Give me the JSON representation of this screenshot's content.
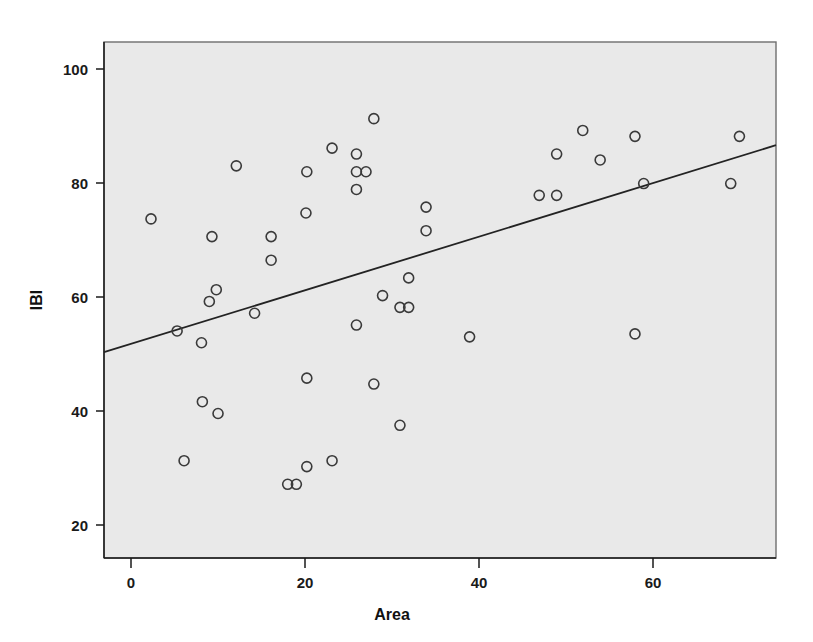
{
  "chart_data": {
    "type": "scatter",
    "title": "",
    "subtitle": "",
    "xlabel": "Area",
    "ylabel": "IBI",
    "xlim": [
      -3,
      74.2
    ],
    "ylim": [
      16.5,
      104
    ],
    "grid": false,
    "legend": null,
    "xticks": [
      0,
      20,
      40,
      60
    ],
    "xtick_labels": [
      "0",
      "20",
      "40",
      "60"
    ],
    "yticks": [
      20,
      40,
      60,
      80,
      100
    ],
    "ytick_labels": [
      "20",
      "40",
      "60",
      "80",
      "100"
    ],
    "marker": "open-circle",
    "marker_color": "#3a3a3a",
    "background_color": "#e9e9e9",
    "frame_color": "#6e6e6e",
    "points": [
      {
        "x": 2.4,
        "y": 74
      },
      {
        "x": 5.4,
        "y": 55
      },
      {
        "x": 6.2,
        "y": 33
      },
      {
        "x": 8.2,
        "y": 53
      },
      {
        "x": 8.3,
        "y": 43
      },
      {
        "x": 9.1,
        "y": 60
      },
      {
        "x": 9.4,
        "y": 71
      },
      {
        "x": 9.9,
        "y": 62
      },
      {
        "x": 10.1,
        "y": 41
      },
      {
        "x": 12.2,
        "y": 83
      },
      {
        "x": 14.3,
        "y": 58
      },
      {
        "x": 16.2,
        "y": 71
      },
      {
        "x": 16.2,
        "y": 67
      },
      {
        "x": 18.1,
        "y": 29
      },
      {
        "x": 19.1,
        "y": 29
      },
      {
        "x": 20.2,
        "y": 75
      },
      {
        "x": 20.3,
        "y": 82
      },
      {
        "x": 20.3,
        "y": 47
      },
      {
        "x": 20.3,
        "y": 32
      },
      {
        "x": 23.2,
        "y": 86
      },
      {
        "x": 23.2,
        "y": 33
      },
      {
        "x": 26.0,
        "y": 85
      },
      {
        "x": 26.0,
        "y": 82
      },
      {
        "x": 27.1,
        "y": 82
      },
      {
        "x": 26.0,
        "y": 79
      },
      {
        "x": 26.0,
        "y": 56
      },
      {
        "x": 28.0,
        "y": 91
      },
      {
        "x": 28.0,
        "y": 46
      },
      {
        "x": 29.0,
        "y": 61
      },
      {
        "x": 31.0,
        "y": 59
      },
      {
        "x": 32.0,
        "y": 59
      },
      {
        "x": 32.0,
        "y": 64
      },
      {
        "x": 31.0,
        "y": 39
      },
      {
        "x": 34.0,
        "y": 76
      },
      {
        "x": 34.0,
        "y": 72
      },
      {
        "x": 39.0,
        "y": 54
      },
      {
        "x": 47.0,
        "y": 78
      },
      {
        "x": 49.0,
        "y": 78
      },
      {
        "x": 49.0,
        "y": 85
      },
      {
        "x": 52.0,
        "y": 89
      },
      {
        "x": 54.0,
        "y": 84
      },
      {
        "x": 58.0,
        "y": 88
      },
      {
        "x": 58.0,
        "y": 54.5
      },
      {
        "x": 59.0,
        "y": 80
      },
      {
        "x": 69.0,
        "y": 80
      },
      {
        "x": 70.0,
        "y": 88
      }
    ],
    "fit_line": {
      "label": "linear-fit",
      "x_start": -3,
      "y_start": 51.4,
      "x_end": 74.2,
      "y_end": 86.5,
      "color": "#232323"
    },
    "n_points": 46
  }
}
